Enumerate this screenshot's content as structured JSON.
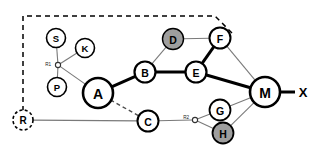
{
  "figure": {
    "kind": "network-graph-diagram",
    "background_color": "#ffffff",
    "stroke_color": "#000000",
    "thin_stroke_color": "#7a7a7a",
    "shaded_fill": "#9e9e9e",
    "node_fill": "#ffffff"
  },
  "nodes": [
    {
      "id": "R",
      "label": "R",
      "cx": 23,
      "cy": 120,
      "r": 10,
      "style": "dashed",
      "fill": "#ffffff",
      "stroke_width": 1.6,
      "font_size": 10
    },
    {
      "id": "S",
      "label": "S",
      "cx": 56,
      "cy": 38,
      "r": 9.5,
      "style": "solid",
      "fill": "#ffffff",
      "stroke_width": 1.6,
      "font_size": 9.5
    },
    {
      "id": "K",
      "label": "K",
      "cx": 85,
      "cy": 48,
      "r": 9.5,
      "style": "solid",
      "fill": "#ffffff",
      "stroke_width": 1.6,
      "font_size": 9.5
    },
    {
      "id": "P",
      "label": "P",
      "cx": 57,
      "cy": 87,
      "r": 9.5,
      "style": "solid",
      "fill": "#ffffff",
      "stroke_width": 1.6,
      "font_size": 9.5
    },
    {
      "id": "A",
      "label": "A",
      "cx": 98,
      "cy": 93,
      "r": 15,
      "style": "solid",
      "fill": "#ffffff",
      "stroke_width": 2.6,
      "font_size": 14
    },
    {
      "id": "B",
      "label": "B",
      "cx": 145,
      "cy": 72,
      "r": 10.5,
      "style": "solid",
      "fill": "#ffffff",
      "stroke_width": 2.2,
      "font_size": 10.5
    },
    {
      "id": "C",
      "label": "C",
      "cx": 148,
      "cy": 121,
      "r": 10.5,
      "style": "solid",
      "fill": "#ffffff",
      "stroke_width": 2.0,
      "font_size": 10.5
    },
    {
      "id": "D",
      "label": "D",
      "cx": 173,
      "cy": 39,
      "r": 10.5,
      "style": "solid",
      "fill": "#9e9e9e",
      "stroke_width": 1.4,
      "font_size": 10.5
    },
    {
      "id": "E",
      "label": "E",
      "cx": 196,
      "cy": 72,
      "r": 10.5,
      "style": "solid",
      "fill": "#ffffff",
      "stroke_width": 2.2,
      "font_size": 10.5
    },
    {
      "id": "F",
      "label": "F",
      "cx": 220,
      "cy": 38,
      "r": 10.5,
      "style": "solid",
      "fill": "#ffffff",
      "stroke_width": 2.0,
      "font_size": 10.5
    },
    {
      "id": "G",
      "label": "G",
      "cx": 220,
      "cy": 110,
      "r": 10.5,
      "style": "solid",
      "fill": "#ffffff",
      "stroke_width": 1.8,
      "font_size": 10.5
    },
    {
      "id": "H",
      "label": "H",
      "cx": 223,
      "cy": 133,
      "r": 10.5,
      "style": "solid",
      "fill": "#9e9e9e",
      "stroke_width": 1.8,
      "font_size": 10.5
    },
    {
      "id": "M",
      "label": "M",
      "cx": 265,
      "cy": 92,
      "r": 15,
      "style": "solid",
      "fill": "#ffffff",
      "stroke_width": 2.6,
      "font_size": 14
    }
  ],
  "junctions": [
    {
      "id": "R1",
      "label": "R1",
      "cx": 58,
      "cy": 65,
      "r": 2.6,
      "label_x": 51,
      "label_y": 64,
      "font_size": 4.6
    },
    {
      "id": "R2",
      "label": "R2",
      "cx": 195,
      "cy": 120,
      "r": 2.6,
      "label_x": 189,
      "label_y": 117,
      "font_size": 4.6
    }
  ],
  "terminals": [
    {
      "id": "X",
      "label": "X",
      "x": 303,
      "y": 92,
      "font_size": 13
    }
  ],
  "edges": [
    {
      "from": "R",
      "to": "C",
      "weight": "thin",
      "dash": "none",
      "note": "R to C horizontal link"
    },
    {
      "from": "C",
      "to": "R2",
      "weight": "thin",
      "dash": "none",
      "note": "C to junction R2"
    },
    {
      "from": "R2",
      "to": "G",
      "weight": "thin",
      "dash": "none",
      "note": "junction R2 to G"
    },
    {
      "from": "R2",
      "to": "H",
      "weight": "thin",
      "dash": "none",
      "note": "junction R2 to H"
    },
    {
      "from": "G",
      "to": "M",
      "weight": "thin",
      "dash": "none",
      "note": "G to M"
    },
    {
      "from": "H",
      "to": "M",
      "weight": "thin",
      "dash": "none",
      "note": "H to M"
    },
    {
      "from": "A",
      "to": "C",
      "weight": "thin",
      "dash": "dashed",
      "note": "A to C dashed link"
    },
    {
      "from": "A",
      "to": "B",
      "weight": "thick",
      "dash": "none",
      "note": "A to B backbone"
    },
    {
      "from": "B",
      "to": "E",
      "weight": "thick",
      "dash": "none",
      "note": "B to E backbone"
    },
    {
      "from": "E",
      "to": "M",
      "weight": "thick",
      "dash": "none",
      "note": "E to M backbone"
    },
    {
      "from": "E",
      "to": "F",
      "weight": "thick",
      "dash": "none",
      "note": "E to F backbone"
    },
    {
      "from": "B",
      "to": "D",
      "weight": "thin",
      "dash": "none",
      "note": "B to D"
    },
    {
      "from": "D",
      "to": "F",
      "weight": "thin",
      "dash": "none",
      "note": "D to F"
    },
    {
      "from": "F",
      "to": "M",
      "weight": "thin",
      "dash": "none",
      "note": "F to M"
    },
    {
      "from": "M",
      "to": "X",
      "weight": "thick",
      "dash": "none",
      "note": "M to external X"
    },
    {
      "from": "S",
      "to": "R1",
      "weight": "thin",
      "dash": "none",
      "note": "S to junction R1"
    },
    {
      "from": "K",
      "to": "R1",
      "weight": "thin",
      "dash": "none",
      "note": "K to junction R1"
    },
    {
      "from": "P",
      "to": "R1",
      "weight": "thin",
      "dash": "none",
      "note": "P to junction R1"
    },
    {
      "from": "R1",
      "to": "A",
      "weight": "thin",
      "dash": "none",
      "note": "junction R1 to A"
    }
  ],
  "boundary": {
    "name": "dashed-region-boundary",
    "dash_pattern": "5,4",
    "stroke_width": 1.5,
    "points": "23,120 23,16 215,16 232,33"
  }
}
